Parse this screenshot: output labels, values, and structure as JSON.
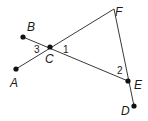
{
  "diagram": {
    "type": "geometry",
    "points": {
      "A": {
        "label": "A",
        "x": 16,
        "y": 69
      },
      "B": {
        "label": "B",
        "x": 23,
        "y": 37
      },
      "C": {
        "label": "C",
        "x": 50,
        "y": 47
      },
      "D": {
        "label": "D",
        "x": 134,
        "y": 106
      },
      "E": {
        "label": "E",
        "x": 128,
        "y": 81
      },
      "F": {
        "label": "F",
        "x": 114,
        "y": 9
      }
    },
    "segments": [
      {
        "from": "A",
        "to": "F"
      },
      {
        "from": "B",
        "to": "E"
      },
      {
        "from": "F",
        "to": "D"
      }
    ],
    "angles": [
      {
        "label": "1",
        "vertex": "C"
      },
      {
        "label": "2",
        "vertex": "E"
      },
      {
        "label": "3",
        "vertex": "C"
      }
    ],
    "colors": {
      "stroke": "#3a3a3a",
      "dot": "#111111"
    }
  }
}
